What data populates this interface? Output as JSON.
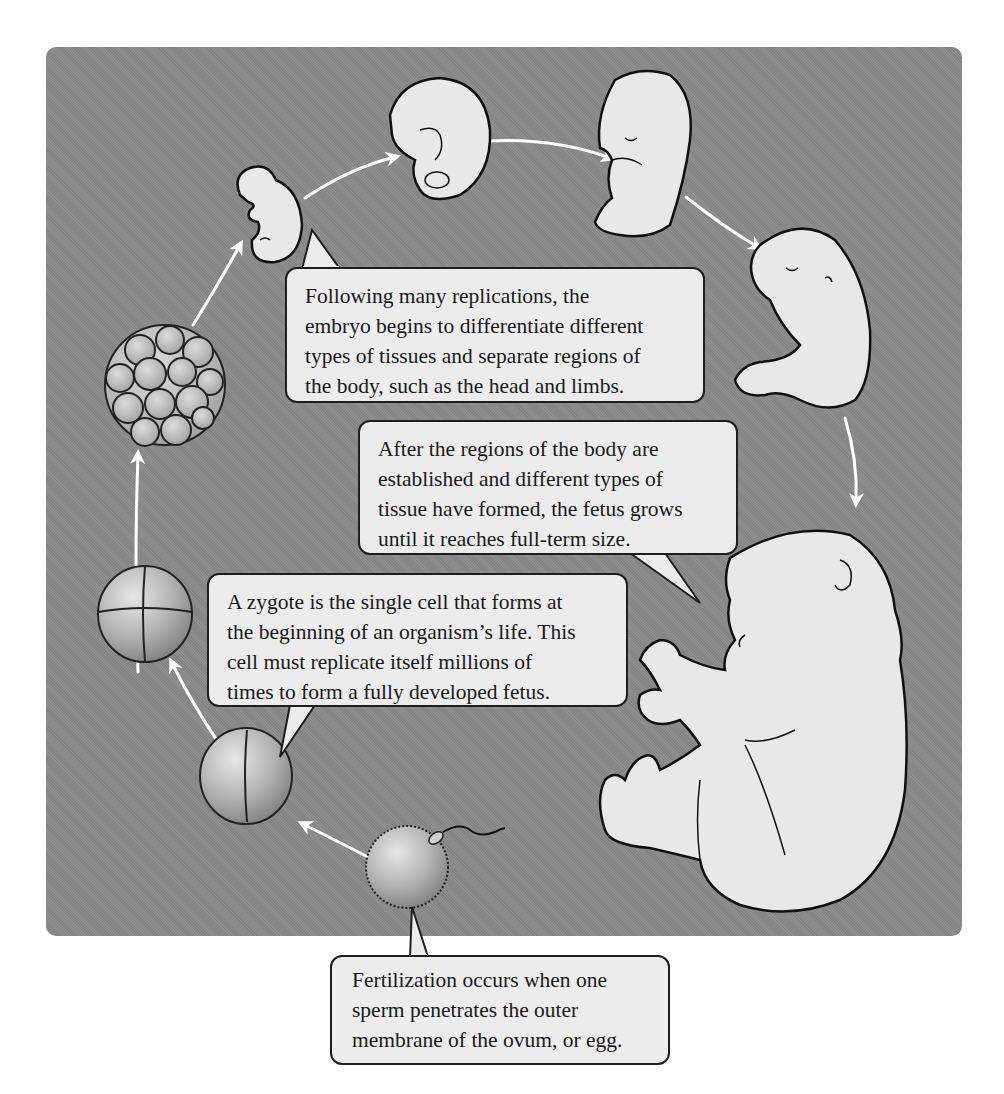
{
  "diagram": {
    "type": "cycle",
    "title": "",
    "background_color": "#8a8a8a",
    "arrow_color": "#ffffff",
    "callout_fill": "#ececec",
    "stages": [
      {
        "id": "fertilized-ovum",
        "label": "Ovum with penetrating sperm"
      },
      {
        "id": "two-cell",
        "label": "Two-cell stage"
      },
      {
        "id": "four-cell",
        "label": "Four-cell stage"
      },
      {
        "id": "morula",
        "label": "Multicell cluster"
      },
      {
        "id": "early-embryo",
        "label": "Early embryo"
      },
      {
        "id": "curled-embryo",
        "label": "Curled embryo"
      },
      {
        "id": "embryo-limb-buds",
        "label": "Embryo with limbs"
      },
      {
        "id": "early-fetus",
        "label": "Early fetus"
      },
      {
        "id": "full-term-fetus",
        "label": "Full-term fetus"
      }
    ],
    "callouts": {
      "differentiation": {
        "lines": [
          "Following many replications, the",
          "embryo begins to differentiate different",
          "types of tissues and separate regions of",
          "the body, such as the head and limbs."
        ]
      },
      "growth": {
        "lines": [
          "After the regions of the body are",
          "established and different types of",
          "tissue have formed, the fetus grows",
          "until it reaches full-term size."
        ]
      },
      "zygote": {
        "lines": [
          "A zygote is the single cell that forms at",
          "the beginning of an organism’s life. This",
          "cell must replicate itself millions of",
          "times to form a fully developed fetus."
        ]
      },
      "fertilization": {
        "lines": [
          "Fertilization occurs when one",
          "sperm penetrates the outer",
          "membrane of the ovum, or egg."
        ]
      }
    }
  }
}
